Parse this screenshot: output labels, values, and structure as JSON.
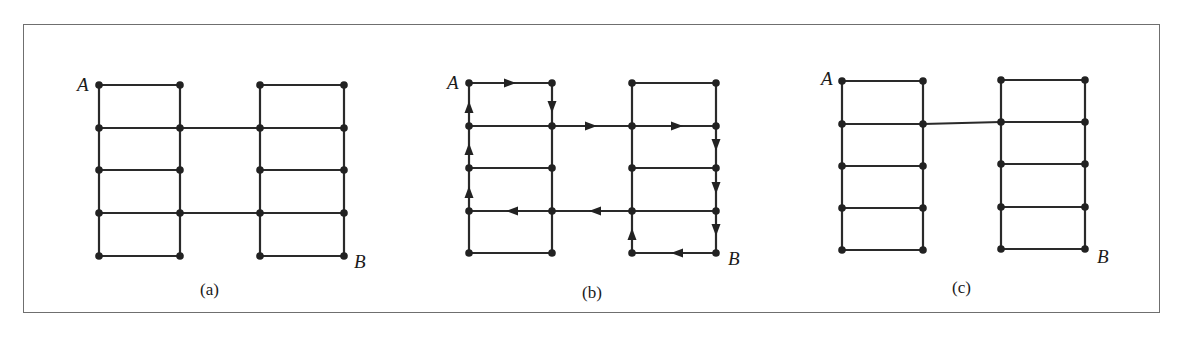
{
  "figure": {
    "colors": {
      "line": "#2a2a2a",
      "node": "#222222",
      "frame": "#6f6f6f"
    },
    "panels": [
      {
        "id": "a",
        "caption": "(a)",
        "start_label": "A",
        "end_label": "B",
        "left_ladder": {
          "x": [
            99,
            180
          ],
          "y": [
            85,
            128,
            170,
            213,
            256
          ]
        },
        "right_ladder": {
          "x": [
            260,
            344
          ],
          "y": [
            85,
            128,
            170,
            213,
            256
          ]
        },
        "bridges_at_rows": [
          2,
          4
        ],
        "arrows": []
      },
      {
        "id": "b",
        "caption": "(b)",
        "start_label": "A",
        "end_label": "B",
        "left_ladder": {
          "x": [
            469,
            552
          ],
          "y": [
            83,
            126,
            168,
            211,
            253
          ]
        },
        "right_ladder": {
          "x": [
            632,
            716
          ],
          "y": [
            83,
            126,
            168,
            211,
            253
          ]
        },
        "bridges_at_rows": [
          2,
          4
        ],
        "arrows": [
          {
            "x": 510,
            "y": 83,
            "dir": "right"
          },
          {
            "x": 552,
            "y": 107,
            "dir": "down"
          },
          {
            "x": 591,
            "y": 126,
            "dir": "right"
          },
          {
            "x": 677,
            "y": 126,
            "dir": "right"
          },
          {
            "x": 716,
            "y": 145,
            "dir": "down"
          },
          {
            "x": 716,
            "y": 188,
            "dir": "down"
          },
          {
            "x": 716,
            "y": 230,
            "dir": "down"
          },
          {
            "x": 677,
            "y": 253,
            "dir": "left"
          },
          {
            "x": 632,
            "y": 234,
            "dir": "up"
          },
          {
            "x": 595,
            "y": 211,
            "dir": "left"
          },
          {
            "x": 512,
            "y": 211,
            "dir": "left"
          },
          {
            "x": 469,
            "y": 192,
            "dir": "up"
          },
          {
            "x": 469,
            "y": 149,
            "dir": "up"
          },
          {
            "x": 469,
            "y": 107,
            "dir": "up"
          }
        ]
      },
      {
        "id": "c",
        "caption": "(c)",
        "start_label": "A",
        "end_label": "B",
        "left_ladder": {
          "x": [
            842,
            923
          ],
          "y": [
            81,
            124,
            166,
            208,
            250
          ]
        },
        "right_ladder": {
          "x": [
            1001,
            1085
          ],
          "y": [
            80,
            122,
            164,
            207,
            249
          ]
        },
        "bridges_at_rows": [
          2
        ],
        "arrows": []
      }
    ]
  }
}
